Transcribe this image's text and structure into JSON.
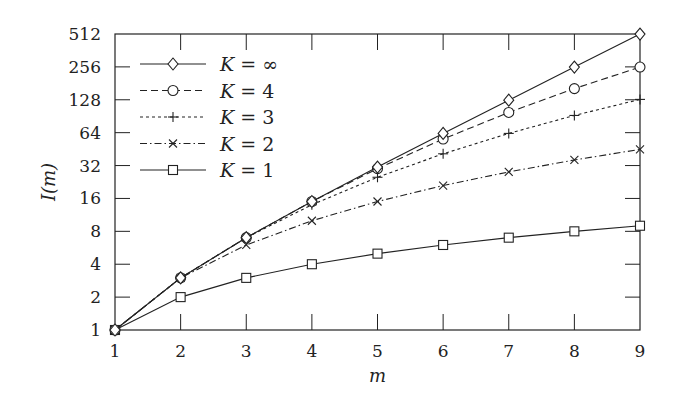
{
  "chart_data": {
    "type": "line",
    "title": "",
    "xlabel": "m",
    "ylabel": "I(m)",
    "x": [
      1,
      2,
      3,
      4,
      5,
      6,
      7,
      8,
      9
    ],
    "xticks": [
      "1",
      "2",
      "3",
      "4",
      "5",
      "6",
      "7",
      "8",
      "9"
    ],
    "yticks": [
      "1",
      "2",
      "4",
      "8",
      "16",
      "32",
      "64",
      "128",
      "256",
      "512"
    ],
    "yscale": "log2",
    "xlim": [
      1,
      9
    ],
    "ylim": [
      1,
      512
    ],
    "grid": false,
    "legend_position": "upper left",
    "series": [
      {
        "name": "K = ∞",
        "marker": "diamond",
        "dash": "solid",
        "values": [
          1,
          3,
          7,
          15,
          31,
          63,
          127,
          255,
          511
        ]
      },
      {
        "name": "K = 4",
        "marker": "circle",
        "dash": "dashed",
        "values": [
          1,
          3,
          7,
          15,
          30,
          56,
          98,
          162,
          255
        ]
      },
      {
        "name": "K = 3",
        "marker": "plus",
        "dash": "dotted",
        "values": [
          1,
          3,
          7,
          14,
          25,
          41,
          63,
          92,
          129
        ]
      },
      {
        "name": "K = 2",
        "marker": "x",
        "dash": "dashdot",
        "values": [
          1,
          3,
          6,
          10,
          15,
          21,
          28,
          36,
          45
        ]
      },
      {
        "name": "K = 1",
        "marker": "square",
        "dash": "solid",
        "values": [
          1,
          2,
          3,
          4,
          5,
          6,
          7,
          8,
          9
        ]
      }
    ]
  }
}
